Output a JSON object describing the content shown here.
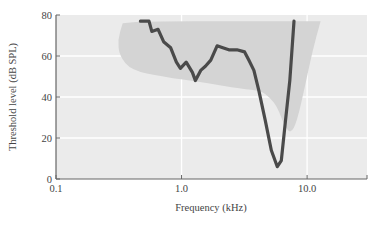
{
  "chart_data": {
    "type": "line",
    "title": "",
    "xlabel": "Frequency (kHz)",
    "ylabel": "Threshold level (dB SPL)",
    "xscale": "log",
    "xlim": [
      0.1,
      30
    ],
    "ylim": [
      0,
      80
    ],
    "grid": true,
    "x_ticks": [
      {
        "value": 0.1,
        "label": "0.1"
      },
      {
        "value": 1.0,
        "label": "1.0"
      },
      {
        "value": 10.0,
        "label": "10.0"
      }
    ],
    "y_ticks": [
      {
        "value": 0,
        "label": "0"
      },
      {
        "value": 20,
        "label": "20"
      },
      {
        "value": 40,
        "label": "40"
      },
      {
        "value": 60,
        "label": "60"
      },
      {
        "value": 80,
        "label": "80"
      }
    ],
    "series": [
      {
        "name": "threshold tuning curve",
        "color": "#4a4a4a",
        "x": [
          0.47,
          0.55,
          0.58,
          0.65,
          0.72,
          0.82,
          0.91,
          0.98,
          1.09,
          1.22,
          1.29,
          1.42,
          1.55,
          1.71,
          1.92,
          2.13,
          2.38,
          2.76,
          3.18,
          3.43,
          3.77,
          4.13,
          4.63,
          5.19,
          5.79,
          6.23,
          6.74,
          7.28,
          7.86
        ],
        "y": [
          77,
          77,
          72,
          73,
          67,
          64,
          57,
          54,
          57,
          52,
          48,
          53,
          55,
          58,
          65,
          64,
          63,
          63,
          62,
          58,
          53,
          43,
          29,
          14,
          6,
          9,
          29,
          48,
          77
        ]
      }
    ],
    "shaded_region": {
      "name": "response area",
      "color": "#d4d4d4",
      "x": [
        0.34,
        0.31,
        0.32,
        0.4,
        0.7,
        1.5,
        3.0,
        4.3,
        5.0,
        5.8,
        6.6,
        7.4,
        8.3,
        9.6,
        11.0,
        12.8,
        12.8,
        3.0,
        0.5,
        0.34
      ],
      "y": [
        76,
        68,
        60,
        53,
        50,
        47,
        44,
        43,
        40,
        35,
        26,
        22,
        28,
        45,
        62,
        77,
        77,
        77,
        77,
        76
      ]
    },
    "plot_background": "#ebebeb",
    "gridline_color": "#ffffff"
  }
}
